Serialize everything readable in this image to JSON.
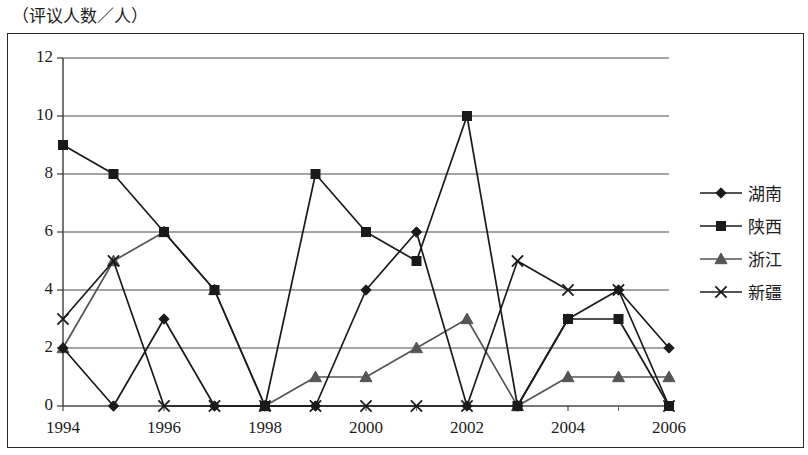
{
  "chart_data": {
    "type": "line",
    "title": "（评议人数／人）",
    "xlabel": "",
    "ylabel": "（评议人数／人）",
    "x": [
      1994,
      1995,
      1996,
      1997,
      1998,
      1999,
      2000,
      2001,
      2002,
      2003,
      2004,
      2005,
      2006
    ],
    "xtick_labels": [
      "1994",
      "",
      "1996",
      "",
      "1998",
      "",
      "2000",
      "",
      "2002",
      "",
      "2004",
      "",
      "2006"
    ],
    "xtick_labels_shown": [
      "1994",
      "1996",
      "1998",
      "2000",
      "2002",
      "2004",
      "2006"
    ],
    "ytick_labels": [
      "0",
      "2",
      "4",
      "6",
      "8",
      "10",
      "12"
    ],
    "yticks": [
      0,
      2,
      4,
      6,
      8,
      10,
      12
    ],
    "ylim": [
      0,
      12
    ],
    "xlim": [
      1994,
      2006
    ],
    "grid": "horizontal",
    "legend_position": "right",
    "series": [
      {
        "name": "湖南",
        "marker": "diamond",
        "color": "#1a1a1a",
        "values": [
          2,
          0,
          3,
          0,
          0,
          0,
          4,
          6,
          0,
          0,
          3,
          4,
          2
        ]
      },
      {
        "name": "陕西",
        "marker": "square",
        "color": "#1a1a1a",
        "values": [
          9,
          8,
          6,
          4,
          0,
          8,
          6,
          5,
          10,
          0,
          3,
          3,
          0
        ]
      },
      {
        "name": "浙江",
        "marker": "triangle",
        "color": "#555555",
        "values": [
          2,
          5,
          6,
          4,
          0,
          1,
          1,
          2,
          3,
          0,
          1,
          1,
          1
        ]
      },
      {
        "name": "新疆",
        "marker": "cross",
        "color": "#1a1a1a",
        "values": [
          3,
          5,
          0,
          0,
          0,
          0,
          0,
          0,
          0,
          5,
          4,
          4,
          0
        ]
      }
    ]
  }
}
